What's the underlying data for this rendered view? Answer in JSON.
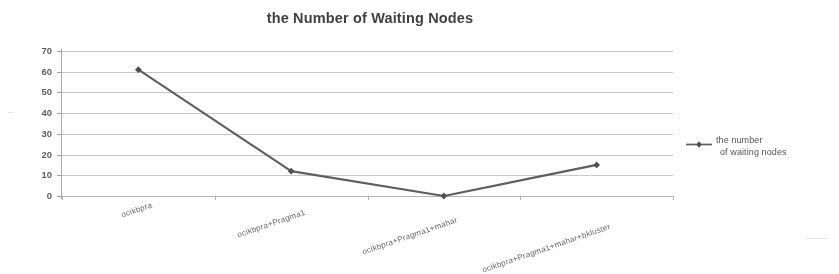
{
  "chart_data": {
    "type": "line",
    "title": "the Number of Waiting Nodes",
    "xlabel": "",
    "ylabel": "",
    "categories": [
      "ocikbpra",
      "ocikbpra+Pragma1",
      "ocikbpra+Pragma1+mahar",
      "ocikbpra+Pragma1+mahar+bkluster"
    ],
    "series": [
      {
        "name": "the number of waiting nodes",
        "values": [
          61,
          12,
          0,
          15
        ]
      }
    ],
    "ylim": [
      0,
      70
    ],
    "yticks": [
      0,
      10,
      20,
      30,
      40,
      50,
      60,
      70
    ],
    "ytick_labels": [
      "0",
      "10",
      "20",
      "30",
      "40",
      "50",
      "60",
      "70"
    ],
    "grid": true,
    "grid_axis": "y",
    "legend": {
      "position": "right",
      "entries": [
        {
          "label_line1": "the number",
          "label_line2": "of waiting nodes",
          "marker": "line-diamond-marker",
          "color": "#595959"
        }
      ]
    },
    "colors": {
      "series_line": "#595959",
      "marker": "#4a4a4a",
      "gridline": "#c9c9c9",
      "axis": "#a8a8a8",
      "title_text": "#3a3a3a",
      "tick_text": "#5a5a5a",
      "background": "#ffffff"
    }
  },
  "legend": {
    "line1": "the number",
    "line2": "of waiting nodes"
  }
}
